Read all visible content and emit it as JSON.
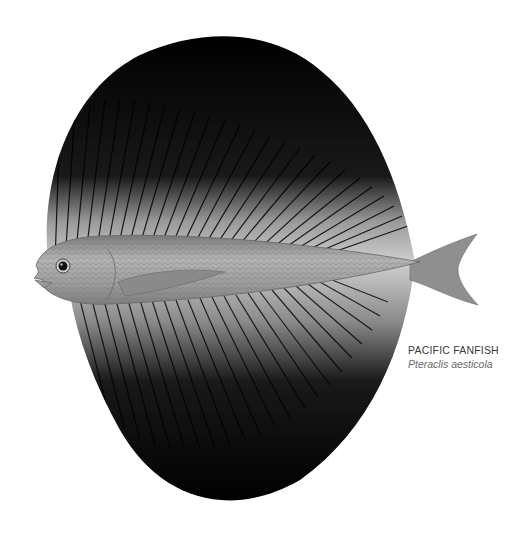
{
  "illustration": {
    "subject": "Pacific fanfish",
    "description": "Scientific illustration of a fish with very large black dorsal and anal fins forming a fan shape",
    "colors": {
      "background": "#ffffff",
      "fin_dark": "#000000",
      "fin_light": "#d8d8d8",
      "body": "#9a9a9a",
      "caption_text": "#3a3a3a",
      "caption_italic": "#6a6a6a"
    }
  },
  "caption": {
    "common_name": "PACIFIC FANFISH",
    "scientific_name": "Pteraclis aesticola"
  }
}
